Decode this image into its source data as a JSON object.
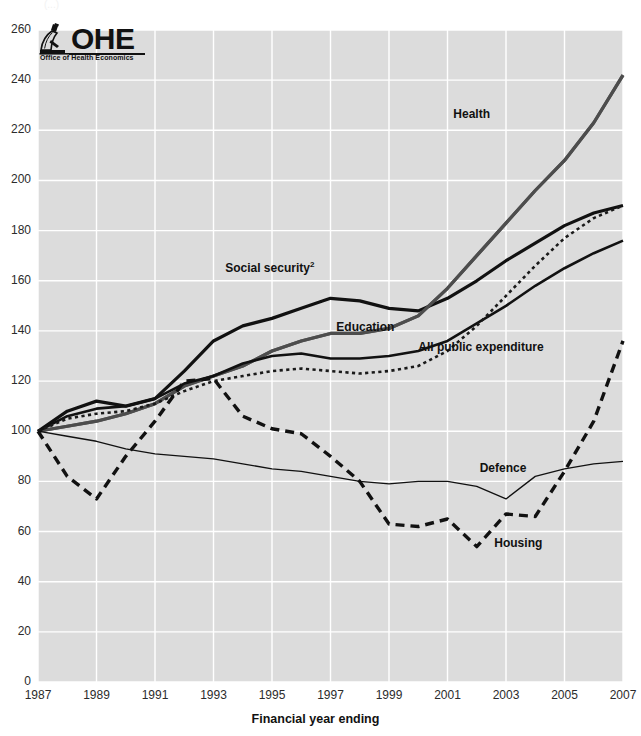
{
  "top_note": "(...)",
  "logo": {
    "name": "OHE",
    "wordmark": "OHE",
    "subtitle": "Office of Health Economics",
    "icon": "microscope-icon"
  },
  "axis": {
    "x_title": "Financial year ending",
    "y_title": ""
  },
  "chart_data": {
    "type": "line",
    "title": "",
    "subtitle": "",
    "xlabel": "Financial year ending",
    "ylabel": "",
    "xlim": [
      1987,
      2007
    ],
    "ylim": [
      0,
      260
    ],
    "ytick_step": 20,
    "xtick_step": 2,
    "grid": true,
    "legend": "inline-labels",
    "plot_background": "#dcdcdc",
    "gridline_color": "#ffffff",
    "yticks": [
      0,
      20,
      40,
      60,
      80,
      100,
      120,
      140,
      160,
      180,
      200,
      220,
      240,
      260
    ],
    "xticks": [
      1987,
      1989,
      1991,
      1993,
      1995,
      1997,
      1999,
      2001,
      2003,
      2005,
      2007
    ],
    "x": [
      1987,
      1988,
      1989,
      1990,
      1991,
      1992,
      1993,
      1994,
      1995,
      1996,
      1997,
      1998,
      1999,
      2000,
      2001,
      2002,
      2003,
      2004,
      2005,
      2006,
      2007
    ],
    "series": [
      {
        "name": "Health",
        "label": "Health",
        "color": "#595959",
        "style": "solid",
        "width": 3.2,
        "values": [
          100,
          102,
          104,
          107,
          111,
          118,
          122,
          126,
          132,
          136,
          139,
          139,
          141,
          146,
          157,
          170,
          183,
          196,
          208,
          223,
          242
        ]
      },
      {
        "name": "Social security",
        "label": "Social security",
        "label_superscript": "2",
        "color": "#111111",
        "style": "solid",
        "width": 3.2,
        "values": [
          100,
          108,
          112,
          110,
          113,
          124,
          136,
          142,
          145,
          149,
          153,
          152,
          149,
          148,
          153,
          160,
          168,
          175,
          182,
          187,
          190
        ]
      },
      {
        "name": "Education",
        "label": "Education",
        "color": "#4d4d4d",
        "style": "solid",
        "width": 3.2,
        "values": [
          100,
          102,
          104,
          107,
          111,
          118,
          122,
          126,
          132,
          136,
          139,
          139,
          141,
          146,
          157,
          170,
          183,
          196,
          208,
          223,
          242
        ]
      },
      {
        "name": "All public expenditure",
        "label": "All public expenditure",
        "color": "#111111",
        "style": "solid",
        "width": 2.6,
        "values": [
          100,
          106,
          109,
          110,
          113,
          119,
          122,
          127,
          130,
          131,
          129,
          129,
          130,
          132,
          136,
          143,
          150,
          158,
          165,
          171,
          176
        ]
      },
      {
        "name": "Education dotted",
        "label": "",
        "color": "#1a1a1a",
        "style": "dotted",
        "width": 2.6,
        "values": [
          100,
          105,
          107,
          108,
          111,
          116,
          120,
          122,
          124,
          125,
          124,
          123,
          124,
          126,
          132,
          142,
          154,
          166,
          177,
          185,
          190
        ]
      },
      {
        "name": "Defence",
        "label": "Defence",
        "color": "#111111",
        "style": "solid",
        "width": 1.3,
        "values": [
          100,
          98,
          96,
          93,
          91,
          90,
          89,
          87,
          85,
          84,
          82,
          80,
          79,
          80,
          80,
          78,
          73,
          82,
          85,
          87,
          88
        ]
      },
      {
        "name": "Housing",
        "label": "Housing",
        "color": "#111111",
        "style": "dashed",
        "width": 3.4,
        "values": [
          100,
          82,
          73,
          90,
          104,
          120,
          121,
          106,
          101,
          99,
          90,
          80,
          63,
          62,
          65,
          54,
          67,
          66,
          84,
          104,
          136
        ]
      }
    ],
    "annotations": [
      {
        "text": "Health",
        "x": 2001.2,
        "y": 226
      },
      {
        "text": "Social security",
        "x": 1993.4,
        "y": 165,
        "superscript": "2"
      },
      {
        "text": "Education",
        "x": 1997.2,
        "y": 141
      },
      {
        "text": "All public expenditure",
        "x": 2000.0,
        "y": 133
      },
      {
        "text": "Defence",
        "x": 2002.1,
        "y": 85
      },
      {
        "text": "Housing",
        "x": 2002.6,
        "y": 55
      }
    ]
  }
}
